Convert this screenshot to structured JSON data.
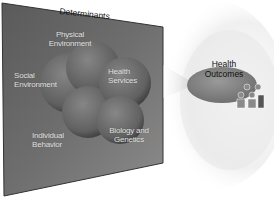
{
  "diagram": {
    "title": "Determinants",
    "determinants": [
      {
        "label_line1": "Physical",
        "label_line2": "Environment"
      },
      {
        "label_line1": "Social",
        "label_line2": "Environment"
      },
      {
        "label_line1": "Health",
        "label_line2": "Services"
      },
      {
        "label_line1": "Individual",
        "label_line2": "Behavior"
      },
      {
        "label_line1": "Biology and",
        "label_line2": "Genetics"
      }
    ],
    "outcome": {
      "label_line1": "Health",
      "label_line2": "Outcomes"
    },
    "icons": {
      "people": "people-group-icon",
      "arrow": "arrow-right-icon"
    },
    "colors": {
      "panel_dark": "#4a4a4a",
      "panel_light": "#8a8a8a",
      "outcome_ellipse": "#8c8c8c",
      "halo": "#e9e9e9",
      "label_text": "#e6e6e6",
      "title_text": "#111111"
    }
  }
}
